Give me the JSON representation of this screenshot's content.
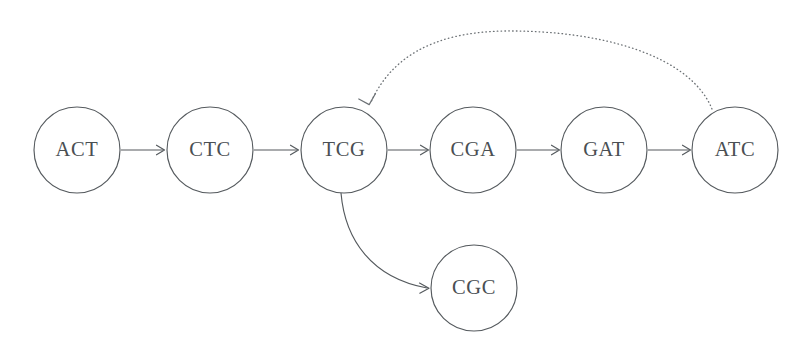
{
  "diagram": {
    "type": "de-bruijn-graph",
    "background_color": "#ffffff",
    "node_stroke_color": "#555a5e",
    "node_fill_color": "#ffffff",
    "label_color": "#4a4f53",
    "edge_color": "#54595d",
    "dotted_edge_color": "#6d7276",
    "nodes": [
      {
        "id": "ACT",
        "label": "ACT",
        "cx": 77,
        "cy": 150,
        "r": 43
      },
      {
        "id": "CTC",
        "label": "CTC",
        "cx": 210,
        "cy": 150,
        "r": 43
      },
      {
        "id": "TCG",
        "label": "TCG",
        "cx": 344,
        "cy": 150,
        "r": 43
      },
      {
        "id": "CGA",
        "label": "CGA",
        "cx": 473,
        "cy": 150,
        "r": 43
      },
      {
        "id": "GAT",
        "label": "GAT",
        "cx": 604,
        "cy": 150,
        "r": 43
      },
      {
        "id": "ATC",
        "label": "ATC",
        "cx": 735,
        "cy": 150,
        "r": 43
      },
      {
        "id": "CGC",
        "label": "CGC",
        "cx": 474,
        "cy": 288,
        "r": 43
      }
    ],
    "edges": [
      {
        "from": "ACT",
        "to": "CTC",
        "style": "solid",
        "shape": "straight"
      },
      {
        "from": "CTC",
        "to": "TCG",
        "style": "solid",
        "shape": "straight"
      },
      {
        "from": "TCG",
        "to": "CGA",
        "style": "solid",
        "shape": "straight"
      },
      {
        "from": "CGA",
        "to": "GAT",
        "style": "solid",
        "shape": "straight"
      },
      {
        "from": "GAT",
        "to": "ATC",
        "style": "solid",
        "shape": "straight"
      },
      {
        "from": "TCG",
        "to": "CGC",
        "style": "solid",
        "shape": "curved"
      },
      {
        "from": "ATC",
        "to": "TCG",
        "style": "dotted",
        "shape": "arc"
      }
    ]
  }
}
